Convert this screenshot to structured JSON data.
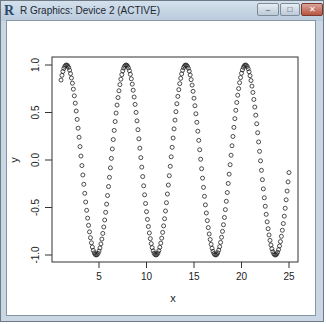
{
  "window": {
    "title": "R Graphics: Device 2 (ACTIVE)",
    "icon": "R-logo-icon",
    "controls": {
      "minimize": "–",
      "maximize": "□",
      "close": "✕"
    }
  },
  "chart_data": {
    "type": "scatter",
    "title": "",
    "xlabel": "x",
    "ylabel": "y",
    "xlim": [
      0.76,
      25.24
    ],
    "ylim": [
      -1.0,
      1.0
    ],
    "x_ticks": [
      5,
      10,
      15,
      20,
      25
    ],
    "x_tick_labels": [
      "5",
      "10",
      "15",
      "20",
      "25"
    ],
    "y_ticks": [
      -1.0,
      -0.5,
      0.0,
      0.5,
      1.0
    ],
    "y_tick_labels": [
      "-1.0",
      "-0.5",
      "0.0",
      "0.5",
      "1.0"
    ],
    "grid": false,
    "legend": null,
    "marker": "open-circle",
    "series": [
      {
        "name": "y = sin(x)",
        "formula": "sin(x)",
        "x_start": 1,
        "x_end": 25,
        "x_step": 0.1,
        "n_points": 241
      }
    ]
  },
  "axes": {
    "xlabel": "x",
    "ylabel": "y",
    "x_tick_labels": [
      "5",
      "10",
      "15",
      "20",
      "25"
    ],
    "y_tick_labels": [
      "-1.0",
      "-0.5",
      "0.0",
      "0.5",
      "1.0"
    ]
  }
}
